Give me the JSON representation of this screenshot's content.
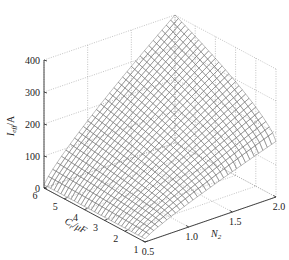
{
  "chart_data": {
    "type": "surface3d",
    "title": "",
    "xlabel": "N₂",
    "ylabel": "Cᵣ/μF",
    "zlabel": "I_eff/A",
    "zlabel_main": "I",
    "zlabel_sub": "eff",
    "zlabel_unit": "/A",
    "ylabel_main": "C",
    "ylabel_sub": "r",
    "ylabel_unit": "/μF",
    "xlabel_main": "N",
    "xlabel_sub": "2",
    "x_ticks": [
      "0.5",
      "1.0",
      "1.5",
      "2.0"
    ],
    "x_range": [
      0.5,
      2.0
    ],
    "y_ticks": [
      "1",
      "2",
      "3",
      "4",
      "5",
      "6"
    ],
    "y_range": [
      1,
      6
    ],
    "z_ticks": [
      "0",
      "100",
      "200",
      "300",
      "400"
    ],
    "z_range": [
      0,
      400
    ],
    "grid": true,
    "surface_samples": {
      "description": "approximate I_eff values read from surface corners",
      "points": [
        {
          "C": 6,
          "N": 0.5,
          "I": 15
        },
        {
          "C": 1,
          "N": 0.5,
          "I": 5
        },
        {
          "C": 6,
          "N": 2.0,
          "I": 400
        },
        {
          "C": 1,
          "N": 2.0,
          "I": 160
        }
      ]
    },
    "mesh_resolution": {
      "c_lines": 30,
      "n_lines": 30
    }
  }
}
